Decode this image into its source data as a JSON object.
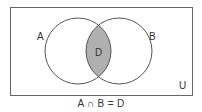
{
  "diagram": {
    "type": "venn",
    "universe": {
      "label": "U",
      "x": 10,
      "y": 7,
      "width": 182,
      "height": 88
    },
    "sets": [
      {
        "label": "A",
        "cx": 78,
        "cy": 51,
        "r": 33,
        "label_x": 40,
        "label_y": 40
      },
      {
        "label": "B",
        "cx": 119,
        "cy": 51,
        "r": 33,
        "label_x": 152,
        "label_y": 40
      }
    ],
    "intersection": {
      "label": "D",
      "fill": "#b0b0b0"
    },
    "caption": "A ∩ B = D"
  },
  "colors": {
    "stroke": "#555555",
    "text": "#333333",
    "intersection_fill": "#b0b0b0",
    "background": "#ffffff"
  }
}
